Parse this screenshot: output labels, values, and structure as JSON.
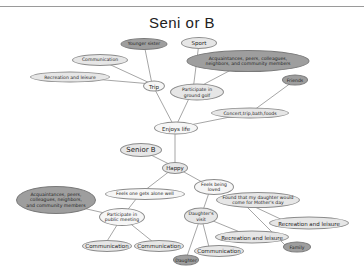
{
  "title": "Seni or  B",
  "nodes": {
    "younger_sister": "Younger sister",
    "sport": "Sport",
    "communication_top": "Communication",
    "acquaintances_top": "Acquaintances, peers, colleagues,\nneighbors, and community members",
    "recreation_top": "Recreation and leisure",
    "trip": "Trip",
    "participate_ground_golf": "Participate in\nground golf",
    "friends": "Friends",
    "concert": "Concert,trip,bath,foods",
    "enjoys_life": "Enjoys life",
    "senior_b": "Senior B",
    "happy": "Happy",
    "feels_alone_well": "Feels one gets alone well",
    "feels_loved": "Feels being\nloved",
    "acquaintances_bottom": "Acquaintances, peers,\ncolleagues, neighbors,\nand community members",
    "participate_meeting": "Participate in\npublic meeting",
    "found_daughter": "Found that my daughter would\ncome for Mother's day",
    "daughters_visit": "Daughter's\nvisit",
    "recreation_right": "Recreation and leisure",
    "recreation_mid": "Recreation and leisure",
    "family": "Family",
    "communication_left": "Communication",
    "communication_mid": "Communication",
    "communication_bottom": "Communication",
    "daughter": "Daughter"
  },
  "colors": {
    "edge": "#7f7f7f",
    "light_node": "#e6e6e6",
    "dark_node": "#9e9e9e"
  }
}
